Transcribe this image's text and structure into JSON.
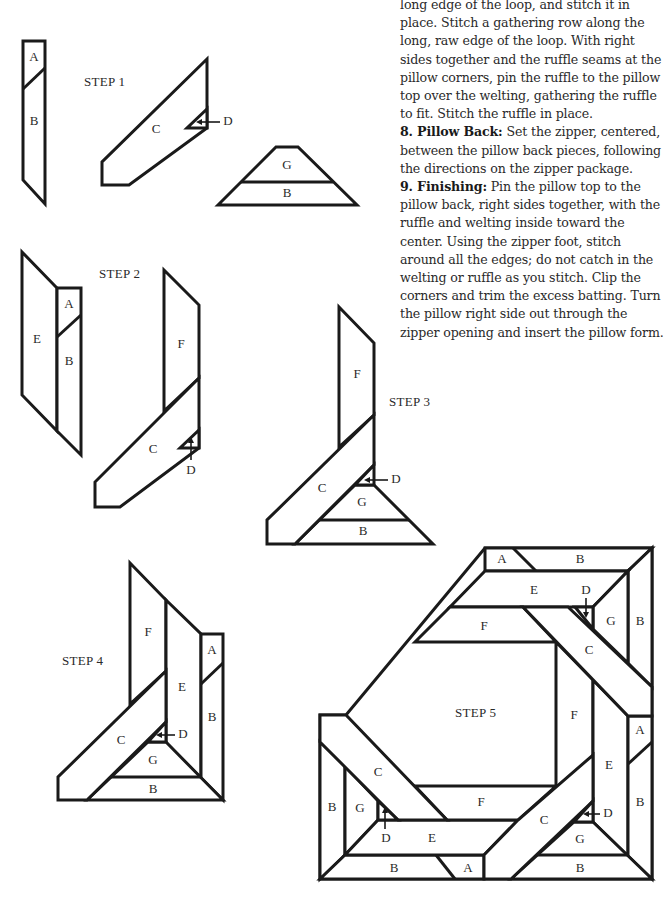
{
  "instructions": {
    "continuation": "long edge of the loop, and stitch it in place. Stitch a gathering row along the long, raw edge of the loop. With right sides together and the ruffle seams at the pillow corners, pin the ruffle to the pillow top over the welting, gathering the ruffle to fit. Stitch the ruffle in place.",
    "steps": [
      {
        "number": "8.",
        "title": "Pillow Back:",
        "text": " Set the zipper, centered, between the pillow back pieces, following the directions on the zipper package."
      },
      {
        "number": "9.",
        "title": "Finishing:",
        "text": " Pin the pillow top to the pillow back, right sides together, with the ruffle and welting inside toward the center. Using the zipper foot, stitch around all the edges; do not catch in the welting or ruffle as you stitch. Clip the corners and trim the excess batting. Turn the pillow right side out through the zipper opening and insert the pillow form."
      }
    ]
  },
  "diagrams": {
    "step1": {
      "title": "STEP 1",
      "labels": {
        "a": "A",
        "b": "B",
        "c": "C",
        "d": "D",
        "g": "G",
        "b2": "B"
      }
    },
    "step2": {
      "title": "STEP 2",
      "labels": {
        "e": "E",
        "a": "A",
        "b": "B",
        "f": "F",
        "c": "C",
        "d": "D"
      }
    },
    "step3": {
      "title": "STEP 3",
      "labels": {
        "f": "F",
        "c": "C",
        "d": "D",
        "g": "G",
        "b": "B"
      }
    },
    "step4": {
      "title": "STEP 4",
      "labels": {
        "f": "F",
        "e": "E",
        "a": "A",
        "b": "B",
        "c": "C",
        "d": "D",
        "g": "G",
        "b2": "B"
      }
    },
    "step5": {
      "title": "STEP 5",
      "labels": {
        "top_a": "A",
        "top_b": "B",
        "top_e": "E",
        "top_d": "D",
        "top_g": "G",
        "top_b_right": "B",
        "top_f": "F",
        "top_c": "C",
        "right_f": "F",
        "right_a": "A",
        "right_e": "E",
        "right_b": "B",
        "right_d": "D",
        "right_c": "C",
        "right_g": "G",
        "bottom_b_right": "B",
        "left_c": "C",
        "left_b": "B",
        "left_g": "G",
        "left_d": "D",
        "left_e": "E",
        "left_f": "F",
        "bottom_b_left": "B",
        "bottom_a": "A"
      }
    }
  }
}
